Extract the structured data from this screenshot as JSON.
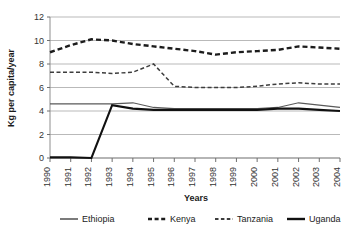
{
  "chart_data": {
    "type": "line",
    "title": "",
    "xlabel": "Years",
    "ylabel": "Kg per capita/year",
    "ylim": [
      0,
      12
    ],
    "yticks": [
      0,
      2,
      4,
      6,
      8,
      10,
      12
    ],
    "grid": true,
    "legend_position": "bottom",
    "categories": [
      "1990",
      "1991",
      "1992",
      "1993",
      "1994",
      "1995",
      "1996",
      "1997",
      "1998",
      "1999",
      "2000",
      "2001",
      "2002",
      "2003",
      "2004"
    ],
    "x": [
      1990,
      1991,
      1992,
      1993,
      1994,
      1995,
      1996,
      1997,
      1998,
      1999,
      2000,
      2001,
      2002,
      2003,
      2004
    ],
    "series": [
      {
        "name": "Ethiopia",
        "style": "solid-thin",
        "color": "#5a5a5a",
        "values": [
          4.6,
          4.6,
          4.6,
          4.6,
          4.7,
          4.3,
          4.2,
          4.2,
          4.2,
          4.2,
          4.2,
          4.3,
          4.7,
          4.5,
          4.3
        ]
      },
      {
        "name": "Kenya",
        "style": "dashed-thick",
        "color": "#1c1c1c",
        "values": [
          9.0,
          9.6,
          10.1,
          10.0,
          9.7,
          9.5,
          9.3,
          9.1,
          8.8,
          9.0,
          9.1,
          9.2,
          9.5,
          9.4,
          9.3
        ]
      },
      {
        "name": "Tanzania",
        "style": "dashed-thin",
        "color": "#3d3d3d",
        "values": [
          7.3,
          7.3,
          7.3,
          7.2,
          7.3,
          8.0,
          6.1,
          6.0,
          6.0,
          6.0,
          6.1,
          6.3,
          6.4,
          6.3,
          6.3
        ]
      },
      {
        "name": "Uganda",
        "style": "solid-thick",
        "color": "#111111",
        "values": [
          0.05,
          0.05,
          0.0,
          4.5,
          4.2,
          4.1,
          4.1,
          4.1,
          4.1,
          4.1,
          4.1,
          4.2,
          4.2,
          4.1,
          4.0
        ]
      }
    ]
  },
  "axes": {
    "y_title": "Kg per capita/year",
    "x_title": "Years",
    "y_tick_labels": [
      "0",
      "2",
      "4",
      "6",
      "8",
      "10",
      "12"
    ],
    "x_tick_labels": [
      "1990",
      "1991",
      "1992",
      "1993",
      "1994",
      "1995",
      "1996",
      "1997",
      "1998",
      "1999",
      "2000",
      "2001",
      "2002",
      "2003",
      "2004"
    ]
  },
  "legend": {
    "items": [
      {
        "label": "Ethiopia"
      },
      {
        "label": "Kenya"
      },
      {
        "label": "Tanzania"
      },
      {
        "label": "Uganda"
      }
    ]
  }
}
